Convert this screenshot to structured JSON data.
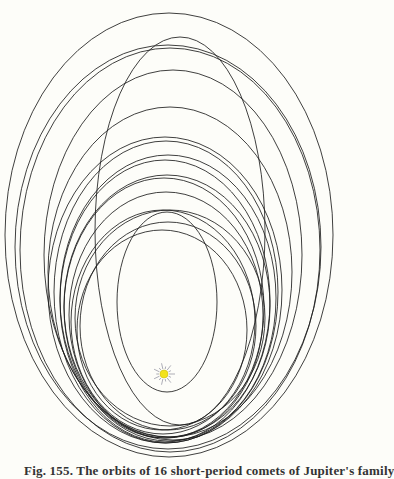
{
  "figure": {
    "background": "#fdfdf9",
    "stroke_color": "#1e1e1e",
    "sun": {
      "cx": 164,
      "cy": 374,
      "r": 4,
      "color": "#f2e21c",
      "ray_color": "#8a8a9a",
      "ray_length": 11,
      "rays": 14
    },
    "orbits": [
      {
        "cx": 169,
        "cy": 235,
        "rx": 164,
        "ry": 222
      },
      {
        "cx": 180,
        "cy": 231,
        "rx": 85,
        "ry": 194
      },
      {
        "cx": 168,
        "cy": 247,
        "rx": 153,
        "ry": 202
      },
      {
        "cx": 170,
        "cy": 250,
        "rx": 150,
        "ry": 202
      },
      {
        "cx": 173,
        "cy": 255,
        "rx": 129,
        "ry": 185
      },
      {
        "cx": 170,
        "cy": 272,
        "rx": 122,
        "ry": 165
      },
      {
        "cx": 165,
        "cy": 290,
        "rx": 117,
        "ry": 153
      },
      {
        "cx": 166,
        "cy": 292,
        "rx": 112,
        "ry": 151
      },
      {
        "cx": 168,
        "cy": 298,
        "rx": 108,
        "ry": 143
      },
      {
        "cx": 165,
        "cy": 301,
        "rx": 105,
        "ry": 141
      },
      {
        "cx": 167,
        "cy": 306,
        "rx": 103,
        "ry": 131
      },
      {
        "cx": 164,
        "cy": 308,
        "rx": 100,
        "ry": 130
      },
      {
        "cx": 166,
        "cy": 315,
        "rx": 97,
        "ry": 123
      },
      {
        "cx": 170,
        "cy": 318,
        "rx": 95,
        "ry": 108
      },
      {
        "cx": 163,
        "cy": 322,
        "rx": 92,
        "ry": 112
      },
      {
        "cx": 168,
        "cy": 326,
        "rx": 88,
        "ry": 104
      },
      {
        "cx": 162,
        "cy": 330,
        "rx": 85,
        "ry": 100
      },
      {
        "cx": 167,
        "cy": 302,
        "rx": 50,
        "ry": 90
      }
    ]
  },
  "caption": {
    "text": "Fig. 155. The orbits of 16 short-period comets of Jupiter's family"
  }
}
